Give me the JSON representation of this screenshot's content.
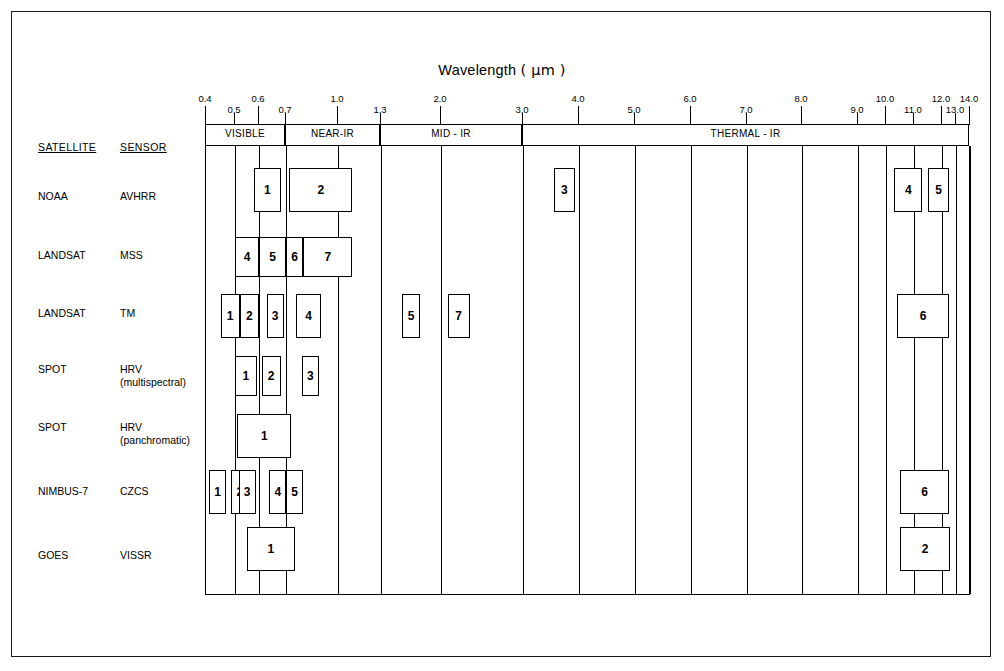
{
  "figure": {
    "title": "Wavelength ( µm )",
    "title_text": "Wavelength",
    "title_units": "( µm )",
    "satellite_header": "SATELLITE",
    "sensor_header": "SENSOR"
  },
  "axis": {
    "major_ticks": [
      "0.4",
      "0.6",
      "1.0",
      "2.0",
      "4.0",
      "6.0",
      "8.0",
      "10.0",
      "12.0",
      "14.0"
    ],
    "minor_ticks": [
      "0.5",
      "0.7",
      "1.3",
      "3.0",
      "5.0",
      "7.0",
      "9.0",
      "11.0",
      "13.0"
    ],
    "all_ticks": [
      "0.4",
      "0.5",
      "0.6",
      "0.7",
      "1.0",
      "1.3",
      "2.0",
      "3.0",
      "4.0",
      "5.0",
      "6.0",
      "7.0",
      "8.0",
      "9.0",
      "10.0",
      "11.0",
      "12.0",
      "13.0",
      "14.0"
    ]
  },
  "regions": [
    {
      "label": "VISIBLE",
      "from": "0.4",
      "to": "0.7"
    },
    {
      "label": "NEAR-IR",
      "from": "0.7",
      "to": "1.3"
    },
    {
      "label": "MID - IR",
      "from": "1.3",
      "to": "3.0"
    },
    {
      "label": "THERMAL - IR",
      "from": "3.0",
      "to": "14.0"
    }
  ],
  "rows": [
    {
      "satellite": "NOAA",
      "sensor": "AVHRR",
      "sensor_sub": ""
    },
    {
      "satellite": "LANDSAT",
      "sensor": "MSS",
      "sensor_sub": ""
    },
    {
      "satellite": "LANDSAT",
      "sensor": "TM",
      "sensor_sub": ""
    },
    {
      "satellite": "SPOT",
      "sensor": "HRV",
      "sensor_sub": "(multispectral)"
    },
    {
      "satellite": "SPOT",
      "sensor": "HRV",
      "sensor_sub": "(panchromatic)"
    },
    {
      "satellite": "NIMBUS-7",
      "sensor": "CZCS",
      "sensor_sub": ""
    },
    {
      "satellite": "GOES",
      "sensor": "VISSR",
      "sensor_sub": ""
    }
  ],
  "chart_data": {
    "type": "bar",
    "title": "Wavelength ( µm )",
    "xlabel": "Wavelength (µm)",
    "ylabel": "",
    "grid": true,
    "legend": "none",
    "axis_ticks": [
      "0.4",
      "0.5",
      "0.6",
      "0.7",
      "1.0",
      "1.3",
      "2.0",
      "3.0",
      "4.0",
      "5.0",
      "6.0",
      "7.0",
      "8.0",
      "9.0",
      "10.0",
      "11.0",
      "12.0",
      "13.0",
      "14.0"
    ],
    "spectral_regions": [
      {
        "name": "VISIBLE",
        "range": [
          0.4,
          0.7
        ]
      },
      {
        "name": "NEAR-IR",
        "range": [
          0.7,
          1.3
        ]
      },
      {
        "name": "MID - IR",
        "range": [
          1.3,
          3.0
        ]
      },
      {
        "name": "THERMAL - IR",
        "range": [
          3.0,
          14.0
        ]
      }
    ],
    "series": [
      {
        "name": "NOAA AVHRR",
        "bands": [
          {
            "label": "1",
            "range": [
              0.58,
              0.68
            ]
          },
          {
            "label": "2",
            "range": [
              0.72,
              1.1
            ]
          },
          {
            "label": "3",
            "range": [
              3.55,
              3.93
            ]
          },
          {
            "label": "4",
            "range": [
              10.3,
              11.3
            ]
          },
          {
            "label": "5",
            "range": [
              11.5,
              12.5
            ]
          }
        ]
      },
      {
        "name": "LANDSAT MSS",
        "bands": [
          {
            "label": "4",
            "range": [
              0.5,
              0.6
            ]
          },
          {
            "label": "5",
            "range": [
              0.6,
              0.7
            ]
          },
          {
            "label": "6",
            "range": [
              0.7,
              0.8
            ]
          },
          {
            "label": "7",
            "range": [
              0.8,
              1.1
            ]
          }
        ]
      },
      {
        "name": "LANDSAT TM",
        "bands": [
          {
            "label": "1",
            "range": [
              0.45,
              0.52
            ]
          },
          {
            "label": "2",
            "range": [
              0.52,
              0.6
            ]
          },
          {
            "label": "3",
            "range": [
              0.63,
              0.69
            ]
          },
          {
            "label": "4",
            "range": [
              0.76,
              0.9
            ]
          },
          {
            "label": "5",
            "range": [
              1.55,
              1.75
            ]
          },
          {
            "label": "7",
            "range": [
              2.08,
              2.35
            ]
          },
          {
            "label": "6",
            "range": [
              10.4,
              12.5
            ]
          }
        ]
      },
      {
        "name": "SPOT HRV (multispectral)",
        "bands": [
          {
            "label": "1",
            "range": [
              0.5,
              0.59
            ]
          },
          {
            "label": "2",
            "range": [
              0.61,
              0.68
            ]
          },
          {
            "label": "3",
            "range": [
              0.79,
              0.89
            ]
          }
        ]
      },
      {
        "name": "SPOT HRV (panchromatic)",
        "bands": [
          {
            "label": "1",
            "range": [
              0.51,
              0.73
            ]
          }
        ]
      },
      {
        "name": "NIMBUS-7 CZCS",
        "bands": [
          {
            "label": "1",
            "range": [
              0.43,
              0.45
            ]
          },
          {
            "label": "2",
            "range": [
              0.51,
              0.53
            ]
          },
          {
            "label": "3",
            "range": [
              0.54,
              0.56
            ]
          },
          {
            "label": "4",
            "range": [
              0.66,
              0.68
            ]
          },
          {
            "label": "5",
            "range": [
              0.7,
              0.8
            ]
          },
          {
            "label": "6",
            "range": [
              10.5,
              12.5
            ]
          }
        ]
      },
      {
        "name": "GOES VISSR",
        "bands": [
          {
            "label": "1",
            "range": [
              0.55,
              0.75
            ]
          },
          {
            "label": "2",
            "range": [
              10.5,
              12.6
            ]
          }
        ]
      }
    ]
  }
}
